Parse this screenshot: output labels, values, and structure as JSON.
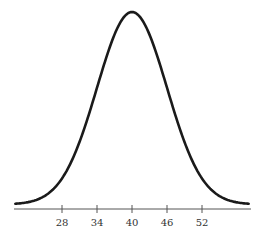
{
  "chart_data": {
    "type": "line",
    "title": "",
    "xlabel": "",
    "ylabel": "",
    "distribution": {
      "mean": 40,
      "sd": 6
    },
    "x_ticks": [
      28,
      34,
      40,
      46,
      52
    ],
    "x_tick_labels": [
      "28",
      "34",
      "40",
      "46",
      "52"
    ],
    "xlim": [
      20,
      60
    ],
    "grid": false,
    "legend": null,
    "colors": {
      "curve": "#1a1a1a",
      "axis": "#555555",
      "text": "#333333"
    }
  }
}
